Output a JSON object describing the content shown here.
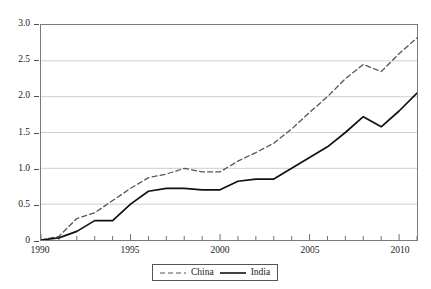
{
  "chart_data": {
    "type": "line",
    "title": "",
    "subtitle": "",
    "xlabel": "",
    "ylabel": "",
    "xlim": [
      1990,
      2011
    ],
    "ylim": [
      0,
      3.0
    ],
    "grid": true,
    "grid_axis": "y",
    "legend_position": "bottom-center",
    "x_tick_labels": [
      "1990",
      "1995",
      "2000",
      "2005",
      "2010"
    ],
    "x_tick_values": [
      1990,
      1995,
      2000,
      2005,
      2010
    ],
    "x_minor_ticks_every": 1,
    "y_tick_labels": [
      "0",
      "0.5",
      "1.0",
      "1.5",
      "2.0",
      "2.5",
      "3.0"
    ],
    "y_tick_values": [
      0,
      0.5,
      1.0,
      1.5,
      2.0,
      2.5,
      3.0
    ],
    "x": [
      1990,
      1991,
      1992,
      1993,
      1994,
      1995,
      1996,
      1997,
      1998,
      1999,
      2000,
      2001,
      2002,
      2003,
      2004,
      2005,
      2006,
      2007,
      2008,
      2009,
      2010,
      2011
    ],
    "series": [
      {
        "name": "China",
        "style": "dashed",
        "color": "#555555",
        "values": [
          0.0,
          0.05,
          0.3,
          0.38,
          0.55,
          0.72,
          0.87,
          0.92,
          1.0,
          0.95,
          0.95,
          1.1,
          1.22,
          1.35,
          1.55,
          1.78,
          2.0,
          2.25,
          2.45,
          2.35,
          2.6,
          2.82
        ]
      },
      {
        "name": "India",
        "style": "solid",
        "color": "#111111",
        "values": [
          0.0,
          0.03,
          0.12,
          0.27,
          0.27,
          0.5,
          0.68,
          0.72,
          0.72,
          0.7,
          0.7,
          0.82,
          0.85,
          0.85,
          1.0,
          1.15,
          1.3,
          1.5,
          1.72,
          1.58,
          1.8,
          2.05
        ]
      }
    ]
  },
  "legend": {
    "entries": [
      {
        "label": "China"
      },
      {
        "label": "India"
      }
    ]
  }
}
